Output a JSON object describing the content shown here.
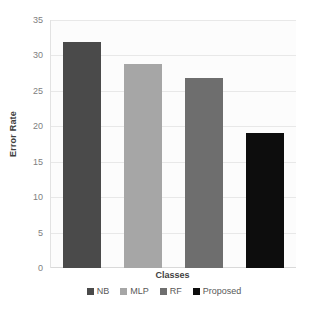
{
  "chart_data": {
    "type": "bar",
    "title": "",
    "xlabel": "Classes",
    "ylabel": "Error Rate",
    "categories": [
      "NB",
      "MLP",
      "RF",
      "Proposed"
    ],
    "values": [
      32,
      29,
      27,
      19.2
    ],
    "series": [
      {
        "name": "Error Rate",
        "values": [
          32,
          29,
          27,
          19.2
        ]
      }
    ],
    "ylim": [
      0,
      35
    ],
    "ytick_step": 5,
    "yticks": [
      35,
      30,
      25,
      20,
      15,
      10,
      5,
      0
    ],
    "ytick_labels": [
      "35",
      "30",
      "25",
      "20",
      "15",
      "10",
      "5",
      "0"
    ],
    "grid": true,
    "grid_axis": "y",
    "legend_position": "bottom",
    "bar_colors": [
      "#4a4a4a",
      "#a6a6a6",
      "#6e6e6e",
      "#0d0d0d"
    ],
    "legend": [
      {
        "label": "NB",
        "color": "#4a4a4a"
      },
      {
        "label": "MLP",
        "color": "#a6a6a6"
      },
      {
        "label": "RF",
        "color": "#6e6e6e"
      },
      {
        "label": "Proposed",
        "color": "#0d0d0d"
      }
    ],
    "plot_background": "#fcfcfc",
    "gridline_color": "#e8e8e8",
    "axis_color": "#d9d9d9"
  }
}
